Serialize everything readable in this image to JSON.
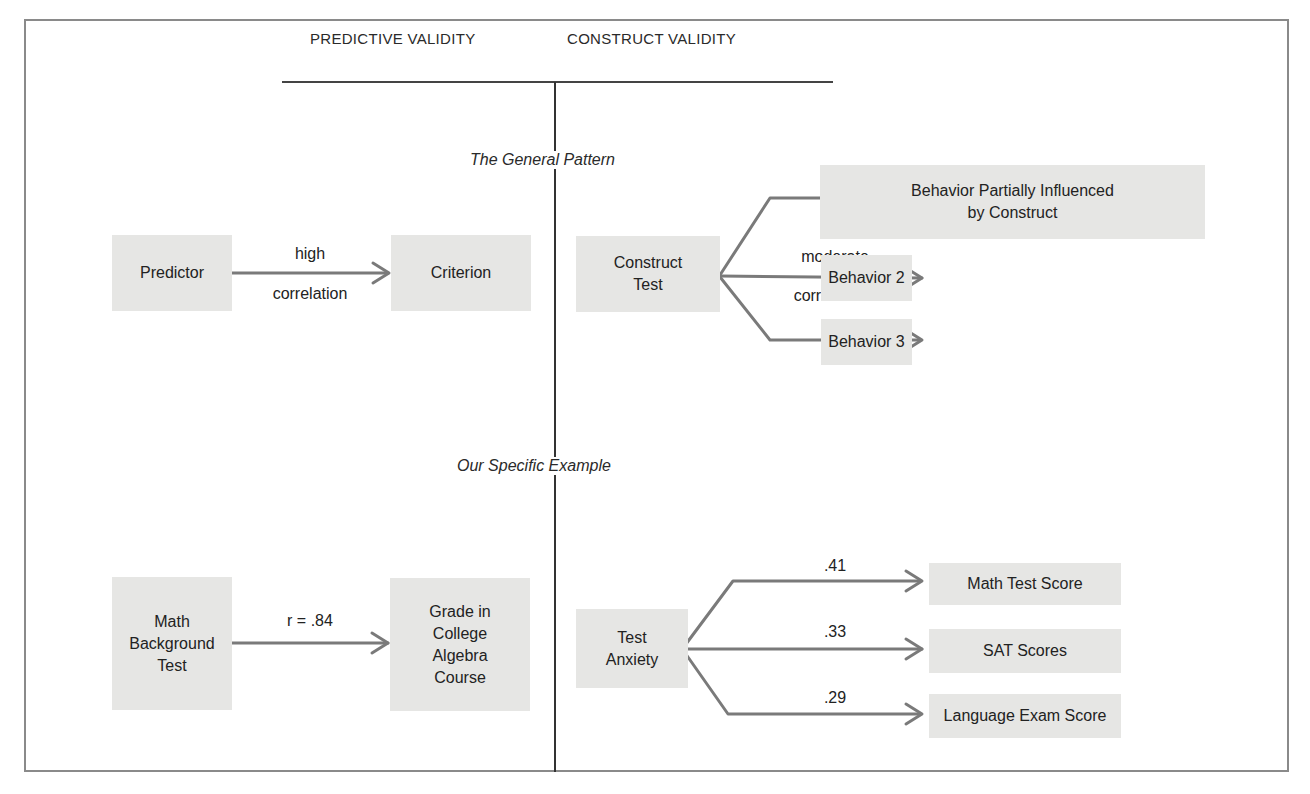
{
  "headers": {
    "left": "PREDICTIVE VALIDITY",
    "right": "CONSTRUCT VALIDITY"
  },
  "sections": {
    "general": "The General Pattern",
    "specific": "Our Specific Example"
  },
  "general_pattern": {
    "predictive": {
      "source": "Predictor",
      "target": "Criterion",
      "label_top": "high",
      "label_bottom": "correlation"
    },
    "construct": {
      "source": "Construct\nTest",
      "targets": [
        "Behavior Partially Influenced\nby Construct",
        "Behavior 2",
        "Behavior 3"
      ],
      "label_top": "moderate",
      "label_bottom": "correlations"
    }
  },
  "specific_example": {
    "predictive": {
      "source": "Math\nBackground\nTest",
      "target": "Grade in\nCollege\nAlgebra\nCourse",
      "label": "r = .84"
    },
    "construct": {
      "source": "Test\nAnxiety",
      "targets": [
        {
          "name": "Math Test Score",
          "r": ".41"
        },
        {
          "name": "SAT Scores",
          "r": ".33"
        },
        {
          "name": "Language Exam Score",
          "r": ".29"
        }
      ]
    }
  },
  "colors": {
    "box_fill": "#e6e6e4",
    "arrow": "#7a7a7a",
    "frame": "#8a8a8a"
  }
}
